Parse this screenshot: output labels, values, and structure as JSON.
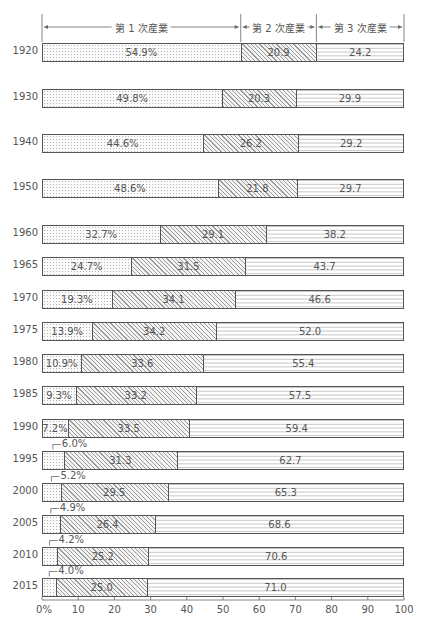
{
  "chart_data": {
    "type": "bar",
    "orientation": "horizontal-stacked-100",
    "title": "",
    "xlabel": "",
    "ylabel": "",
    "xlim": [
      0,
      100
    ],
    "x_ticks": [
      "0%",
      "10",
      "20",
      "30",
      "40",
      "50",
      "60",
      "70",
      "80",
      "90",
      "100"
    ],
    "categories": [
      "1920",
      "1930",
      "1940",
      "1950",
      "1960",
      "1965",
      "1970",
      "1975",
      "1980",
      "1985",
      "1990",
      "1995",
      "2000",
      "2005",
      "2010",
      "2015"
    ],
    "series": [
      {
        "name": "第 1 次産業",
        "pattern": "dots",
        "values": [
          54.9,
          49.8,
          44.6,
          48.6,
          32.7,
          24.7,
          19.3,
          13.9,
          10.9,
          9.3,
          7.2,
          6.0,
          5.2,
          4.9,
          4.2,
          4.0
        ],
        "labels": [
          "54.9%",
          "49.8%",
          "44.6%",
          "48.6%",
          "32.7%",
          "24.7%",
          "19.3%",
          "13.9%",
          "10.9%",
          "9.3%",
          "7.2%",
          "6.0%",
          "5.2%",
          "4.9%",
          "4.2%",
          "4.0%"
        ]
      },
      {
        "name": "第 2 次産業",
        "pattern": "diagonal-hatch",
        "values": [
          20.9,
          20.3,
          26.2,
          21.8,
          29.1,
          31.5,
          34.1,
          34.2,
          33.6,
          33.2,
          33.5,
          31.3,
          29.5,
          26.4,
          25.2,
          25.0
        ],
        "labels": [
          "20.9",
          "20.3",
          "26.2",
          "21.8",
          "29.1",
          "31.5",
          "34.1",
          "34.2",
          "33.6",
          "33.2",
          "33.5",
          "31.3",
          "29.5",
          "26.4",
          "25.2",
          "25.0"
        ]
      },
      {
        "name": "第 3 次産業",
        "pattern": "dashed-horizontal",
        "values": [
          24.2,
          29.9,
          29.2,
          29.7,
          38.2,
          43.7,
          46.6,
          52.0,
          55.4,
          57.5,
          59.4,
          62.7,
          65.3,
          68.6,
          70.6,
          71.0
        ],
        "labels": [
          "24.2",
          "29.9",
          "29.2",
          "29.7",
          "38.2",
          "43.7",
          "46.6",
          "52.0",
          "55.4",
          "57.5",
          "59.4",
          "62.7",
          "65.3",
          "68.6",
          "70.6",
          "71.0"
        ]
      }
    ],
    "header_spans": [
      {
        "label": "第 1 次産業",
        "from": 0,
        "to": 54.9
      },
      {
        "label": "第 2 次産業",
        "from": 54.9,
        "to": 75.8
      },
      {
        "label": "第 3 次産業",
        "from": 75.8,
        "to": 100
      }
    ],
    "callouts_above_bar": [
      "1995",
      "2000",
      "2005",
      "2010",
      "2015"
    ],
    "grid": false,
    "legend_position": "top-header-brackets"
  },
  "layout": {
    "x0": 42,
    "x100": 404,
    "bar_centers": [
      52,
      98,
      143,
      188,
      234,
      266,
      299,
      331,
      363,
      395,
      428,
      460,
      492,
      524,
      556,
      587
    ]
  }
}
